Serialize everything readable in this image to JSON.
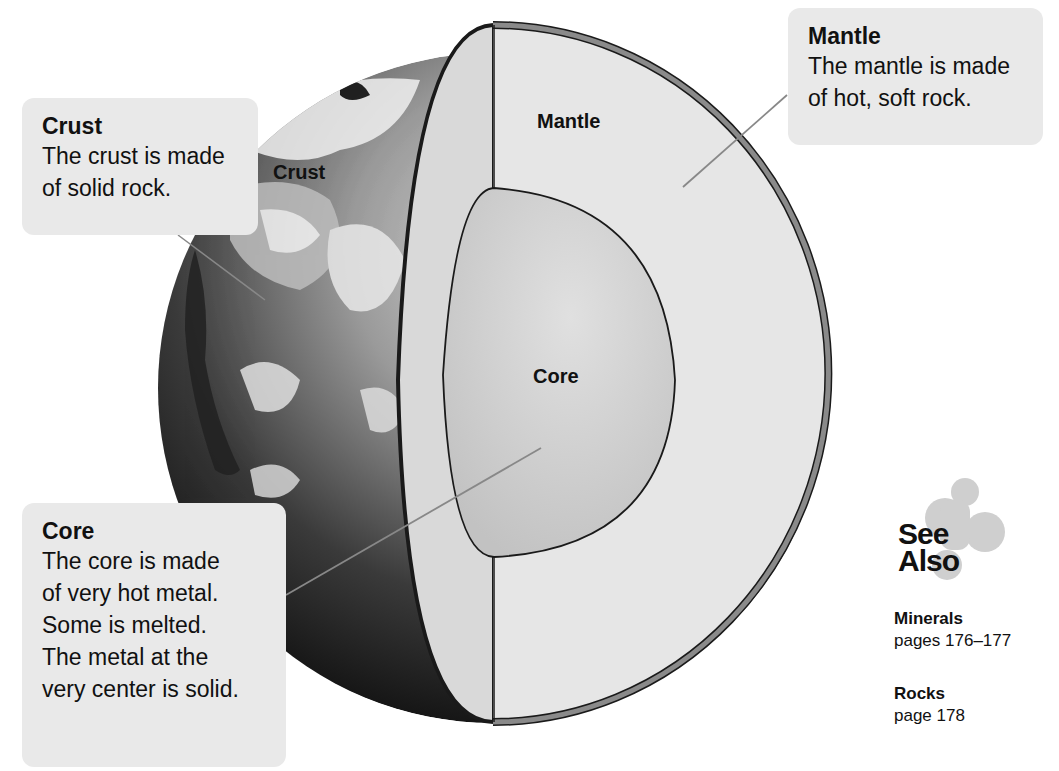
{
  "diagram": {
    "layer_labels": {
      "crust": "Crust",
      "mantle": "Mantle",
      "core": "Core"
    },
    "colors": {
      "background": "#ffffff",
      "callout_bg": "#e9e9e9",
      "mantle_fill": "#e6e6e6",
      "mantle_side_fill": "#d9d9d9",
      "core_fill": "#d0d0d0",
      "crust_rim": "#8a8a8a",
      "outline": "#1a1a1a",
      "leader_line": "#888888"
    }
  },
  "callouts": {
    "crust": {
      "title": "Crust",
      "lines": [
        "The crust is made",
        "of solid rock."
      ]
    },
    "mantle": {
      "title": "Mantle",
      "lines": [
        "The mantle is made",
        "of hot, soft rock."
      ]
    },
    "core": {
      "title": "Core",
      "lines": [
        "The core is made",
        "of very hot metal.",
        "Some is melted.",
        "The metal at the",
        "very center is solid."
      ]
    }
  },
  "see_also": {
    "title_line1": "See",
    "title_line2": "Also",
    "icon": "puzzle-blob-icon",
    "references": [
      {
        "name": "Minerals",
        "pages": "pages 176–177"
      },
      {
        "name": "Rocks",
        "pages": "page 178"
      }
    ]
  }
}
